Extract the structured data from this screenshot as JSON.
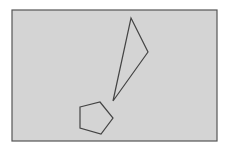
{
  "canvas": {
    "width": 229,
    "height": 152,
    "background": "#ffffff"
  },
  "panel": {
    "x": 12,
    "y": 10,
    "width": 205,
    "height": 131,
    "fill": "#d4d4d4",
    "stroke": "#555555"
  },
  "shapes": {
    "triangle": {
      "points": "131,18 148,52 113,101",
      "stroke": "#444444",
      "fill": "none"
    },
    "pentagon": {
      "points": "80,107 100,102 113,118 101,134 80,128",
      "stroke": "#444444",
      "fill": "none"
    }
  }
}
